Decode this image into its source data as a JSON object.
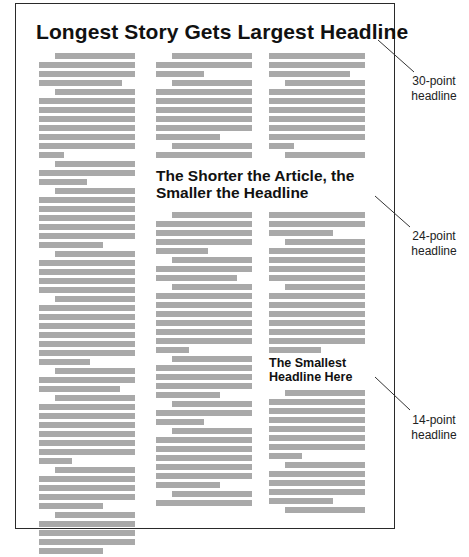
{
  "figure": {
    "headlines": {
      "large": "Longest Story Gets Largest Headline",
      "medium": "The Shorter the Article, the Smaller the Headline",
      "small": "The Smallest Headline Here"
    },
    "callouts": [
      {
        "label_line1": "30-point",
        "label_line2": "headline"
      },
      {
        "label_line1": "24-point",
        "label_line2": "headline"
      },
      {
        "label_line1": "14-point",
        "label_line2": "headline"
      }
    ],
    "columns": {
      "left": {
        "x": 39,
        "y": 53,
        "lines": [
          [
            1,
            1
          ],
          [
            0,
            1
          ],
          [
            0,
            1
          ],
          [
            0,
            0.86
          ],
          [
            1,
            1
          ],
          [
            0,
            1
          ],
          [
            0,
            1
          ],
          [
            0,
            1
          ],
          [
            0,
            1
          ],
          [
            0,
            1
          ],
          [
            0,
            1
          ],
          [
            0,
            0.26
          ],
          [
            1,
            1
          ],
          [
            0,
            1
          ],
          [
            0,
            0.5
          ],
          [
            1,
            1
          ],
          [
            0,
            1
          ],
          [
            0,
            1
          ],
          [
            0,
            1
          ],
          [
            0,
            1
          ],
          [
            0,
            1
          ],
          [
            0,
            0.67
          ],
          [
            1,
            1
          ],
          [
            0,
            1
          ],
          [
            0,
            1
          ],
          [
            0,
            1
          ],
          [
            0,
            1
          ],
          [
            1,
            1
          ],
          [
            0,
            1
          ],
          [
            0,
            1
          ],
          [
            0,
            1
          ],
          [
            0,
            1
          ],
          [
            0,
            1
          ],
          [
            0,
            1
          ],
          [
            0,
            0.53
          ],
          [
            1,
            1
          ],
          [
            0,
            1
          ],
          [
            0,
            0.84
          ],
          [
            1,
            1
          ],
          [
            0,
            1
          ],
          [
            0,
            1
          ],
          [
            0,
            1
          ],
          [
            0,
            1
          ],
          [
            0,
            1
          ],
          [
            0,
            1
          ],
          [
            0,
            0.34
          ],
          [
            1,
            1
          ],
          [
            0,
            1
          ],
          [
            0,
            1
          ],
          [
            0,
            1
          ],
          [
            0,
            0.67
          ],
          [
            1,
            1
          ],
          [
            0,
            1
          ],
          [
            0,
            1
          ],
          [
            0,
            1
          ],
          [
            0,
            0.67
          ]
        ]
      },
      "middle_top": {
        "x": 156,
        "y": 53,
        "lines": [
          [
            1,
            1
          ],
          [
            0,
            1
          ],
          [
            0,
            0.5
          ],
          [
            1,
            1
          ],
          [
            0,
            1
          ],
          [
            0,
            1
          ],
          [
            0,
            1
          ],
          [
            0,
            1
          ],
          [
            0,
            1
          ],
          [
            0,
            0.67
          ],
          [
            1,
            1
          ],
          [
            0,
            1
          ]
        ]
      },
      "middle_bottom": {
        "x": 156,
        "y": 212,
        "lines": [
          [
            1,
            1
          ],
          [
            0,
            1
          ],
          [
            0,
            1
          ],
          [
            0,
            1
          ],
          [
            0,
            0.54
          ],
          [
            1,
            1
          ],
          [
            0,
            1
          ],
          [
            0,
            0.84
          ],
          [
            1,
            1
          ],
          [
            0,
            1
          ],
          [
            0,
            1
          ],
          [
            0,
            1
          ],
          [
            0,
            1
          ],
          [
            0,
            1
          ],
          [
            0,
            1
          ],
          [
            0,
            0.34
          ],
          [
            1,
            1
          ],
          [
            0,
            1
          ],
          [
            0,
            1
          ],
          [
            0,
            1
          ],
          [
            0,
            0.67
          ],
          [
            1,
            1
          ],
          [
            0,
            1
          ],
          [
            0,
            0.5
          ],
          [
            1,
            1
          ],
          [
            0,
            1
          ],
          [
            0,
            1
          ],
          [
            0,
            1
          ],
          [
            0,
            1
          ],
          [
            0,
            1
          ],
          [
            0,
            0.67
          ],
          [
            1,
            1
          ],
          [
            0,
            1
          ]
        ]
      },
      "right_top": {
        "x": 269,
        "y": 53,
        "lines": [
          [
            0,
            1
          ],
          [
            0,
            1
          ],
          [
            0,
            0.84
          ],
          [
            1,
            1
          ],
          [
            0,
            1
          ],
          [
            0,
            1
          ],
          [
            0,
            1
          ],
          [
            0,
            1
          ],
          [
            0,
            1
          ],
          [
            0,
            1
          ],
          [
            0,
            0.26
          ],
          [
            1,
            1
          ]
        ]
      },
      "right_middle": {
        "x": 269,
        "y": 212,
        "lines": [
          [
            0,
            1
          ],
          [
            0,
            1
          ],
          [
            0,
            0.67
          ],
          [
            1,
            1
          ],
          [
            0,
            1
          ],
          [
            0,
            1
          ],
          [
            0,
            1
          ],
          [
            0,
            1
          ],
          [
            1,
            1
          ],
          [
            0,
            1
          ],
          [
            0,
            1
          ],
          [
            0,
            1
          ],
          [
            0,
            1
          ],
          [
            0,
            1
          ],
          [
            0,
            1
          ],
          [
            0,
            0.54
          ]
        ]
      },
      "right_bottom": {
        "x": 269,
        "y": 390,
        "lines": [
          [
            1,
            1
          ],
          [
            0,
            1
          ],
          [
            0,
            1
          ],
          [
            0,
            1
          ],
          [
            0,
            1
          ],
          [
            0,
            1
          ],
          [
            0,
            1
          ],
          [
            0,
            0.34
          ],
          [
            1,
            1
          ],
          [
            0,
            1
          ],
          [
            0,
            1
          ],
          [
            0,
            1
          ],
          [
            0,
            0.67
          ],
          [
            1,
            1
          ]
        ]
      }
    },
    "colors": {
      "text_bar": "#a9a9a9",
      "frame": "#2a2a2a",
      "headline": "#111111"
    }
  }
}
